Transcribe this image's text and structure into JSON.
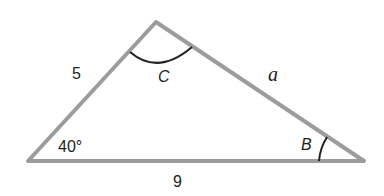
{
  "diagram": {
    "type": "triangle",
    "vertices": {
      "A": {
        "x": 28,
        "y": 161
      },
      "C": {
        "x": 156,
        "y": 22
      },
      "B": {
        "x": 364,
        "y": 161
      }
    },
    "colors": {
      "edge": "#9c9c9c",
      "arc": "#222222",
      "text": "#222222"
    },
    "labels": {
      "side_AC": "5",
      "side_CB": "a",
      "side_AB": "9",
      "angle_A": "40°",
      "angle_C": "C",
      "angle_B": "B"
    }
  }
}
